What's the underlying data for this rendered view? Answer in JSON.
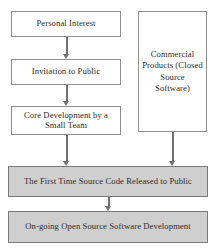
{
  "diagram": {
    "type": "flowchart",
    "canvas": {
      "width": 220,
      "height": 251,
      "background": "#ffffff"
    },
    "colors": {
      "plain_fill": "#ffffff",
      "shaded_fill": "#cfcfcf",
      "border": "#8d8d8d",
      "arrow": "#6f6f6f",
      "text": "#2b2b2b"
    },
    "nodes": [
      {
        "id": "personal-interest",
        "label": "Personal Interest",
        "style": "plain",
        "column": "left",
        "rect": {
          "x": 11,
          "y": 11,
          "w": 110,
          "h": 26
        }
      },
      {
        "id": "invitation-to-public",
        "label": "Invitation to Public",
        "style": "plain",
        "column": "left",
        "rect": {
          "x": 11,
          "y": 59,
          "w": 110,
          "h": 26
        }
      },
      {
        "id": "core-development",
        "label": "Core Development by a Small Team",
        "style": "plain",
        "column": "left",
        "rect": {
          "x": 11,
          "y": 106,
          "w": 110,
          "h": 29
        }
      },
      {
        "id": "commercial-products",
        "label": "Commercial Products (Closed Source Software)",
        "style": "plain",
        "column": "right",
        "rect": {
          "x": 138,
          "y": 11,
          "w": 69,
          "h": 121
        }
      },
      {
        "id": "first-time-source-release",
        "label": "The First Time Source Code Released to Public",
        "style": "shaded",
        "column": "full",
        "rect": {
          "x": 8,
          "y": 166,
          "w": 200,
          "h": 31
        }
      },
      {
        "id": "ongoing-open-source-development",
        "label": "On-going Open Source Software Development",
        "style": "shaded",
        "column": "full",
        "rect": {
          "x": 8,
          "y": 211,
          "w": 200,
          "h": 32
        }
      }
    ],
    "arrows": [
      {
        "id": "arrow-personal-to-invitation",
        "from": "personal-interest",
        "to": "invitation-to-public",
        "x": 66,
        "y": 37,
        "length": 22
      },
      {
        "id": "arrow-invitation-to-core",
        "from": "invitation-to-public",
        "to": "core-development",
        "x": 66,
        "y": 85,
        "length": 21
      },
      {
        "id": "arrow-core-to-release",
        "from": "core-development",
        "to": "first-time-source-release",
        "x": 66,
        "y": 135,
        "length": 31
      },
      {
        "id": "arrow-commercial-to-release",
        "from": "commercial-products",
        "to": "first-time-source-release",
        "x": 172,
        "y": 132,
        "length": 34
      },
      {
        "id": "arrow-release-to-ongoing",
        "from": "first-time-source-release",
        "to": "ongoing-open-source-development",
        "x": 108,
        "y": 197,
        "length": 14
      }
    ]
  }
}
